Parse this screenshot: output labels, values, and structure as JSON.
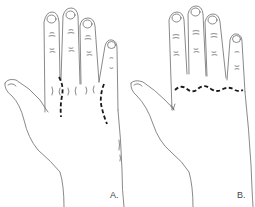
{
  "figure": {
    "panels": [
      {
        "id": "A",
        "label": "A.",
        "incision": "two longitudinal dashed incisions between metacarpals"
      },
      {
        "id": "B",
        "label": "B.",
        "incision": "transverse wavy dashed incision across the metacarpal heads"
      }
    ],
    "colors": {
      "outline": "#6b6b6b",
      "incision": "#1a1a1a",
      "background": "#ffffff"
    }
  }
}
